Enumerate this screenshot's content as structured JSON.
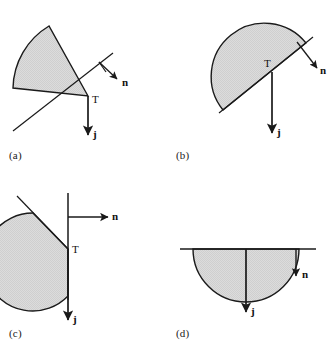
{
  "figure": {
    "background_color": "#ffffff",
    "stroke_color": "#1a1a1a",
    "fill_color": "#d9d9d9",
    "panels": [
      {
        "id": "a",
        "caption": "(a)",
        "point_label": "T",
        "normal_label": "n",
        "current_label": "j",
        "shape": "circular-sector-wedge",
        "description": "Shaded circular sector with vertex at T, arc bulging to the upper-left; tangent line through T rising to the right, outward normal n perpendicular to tangent pointing down-right, vertical downward arrow j at T."
      },
      {
        "id": "b",
        "caption": "(b)",
        "point_label": "T",
        "normal_label": "n",
        "current_label": "j",
        "shape": "half-disk-tilted",
        "description": "Shaded half-disk whose flat diameter edge is tilted, running from lower-left up to the right; T sits on that edge, outward normal n points down-right perpendicular to the edge, vertical downward arrow j from T."
      },
      {
        "id": "c",
        "caption": "(c)",
        "point_label": "T",
        "normal_label": "n",
        "current_label": "j",
        "shape": "half-disk-left-of-vertical-line",
        "description": "Shaded region lying to the left of a vertical straight line; T marks the point on the vertical line, outward normal n points horizontally to the right, downward arrow j runs along the vertical line."
      },
      {
        "id": "d",
        "caption": "(d)",
        "point_label": "T",
        "normal_label": "n",
        "current_label": "j",
        "shape": "half-disk-below-horizontal-line",
        "description": "Shaded half-disk hanging below a horizontal straight line; outward normal n is a short arrow pointing straight down at the right, and j is a long downward arrow through the centre."
      }
    ]
  }
}
